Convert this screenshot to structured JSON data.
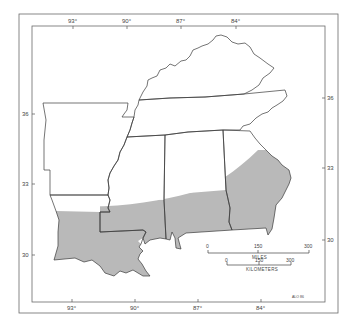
{
  "map": {
    "colors": {
      "range_fill": "#b9b9b9",
      "state_stroke": "#3a3a3a",
      "frame_stroke": "#6a6a6a",
      "background": "#ffffff"
    },
    "longitude_labels_top": [
      "93°",
      "90°",
      "87°",
      "84°"
    ],
    "longitude_labels_bottom": [
      "93°",
      "90°",
      "87°",
      "84°"
    ],
    "latitude_labels_left": [
      "36",
      "33",
      "30"
    ],
    "latitude_labels_right": [
      "36",
      "33",
      "30"
    ],
    "scale": {
      "miles": {
        "title": "MILES",
        "ticks": [
          "0",
          "150",
          "300"
        ]
      },
      "kilometers": {
        "title": "KILOMETERS",
        "ticks": [
          "0",
          "150",
          "300"
        ]
      }
    },
    "credit": "ALO 86",
    "shaded_region": "Distribution range across southern Louisiana, Mississippi, Alabama and southern/eastern Georgia"
  }
}
